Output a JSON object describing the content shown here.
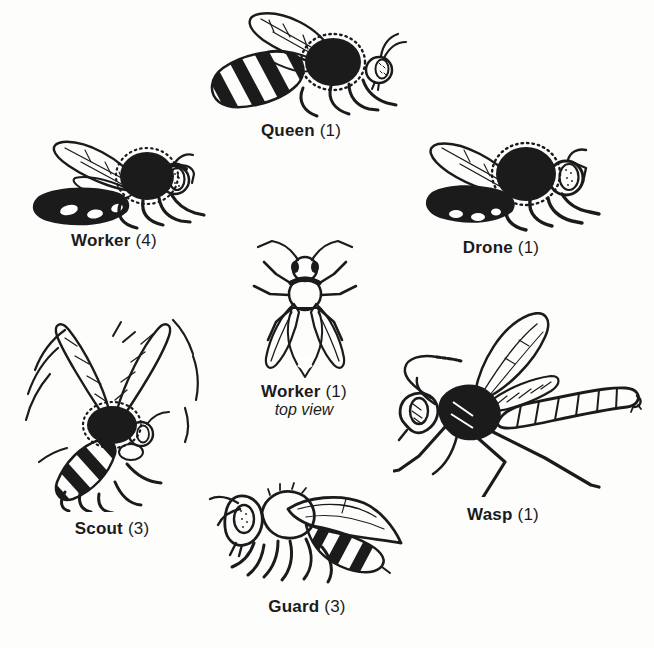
{
  "figure": {
    "items": [
      {
        "id": "queen",
        "label": "Queen",
        "count": "(1)"
      },
      {
        "id": "worker-side",
        "label": "Worker",
        "count": "(4)"
      },
      {
        "id": "drone",
        "label": "Drone",
        "count": "(1)"
      },
      {
        "id": "worker-top",
        "label": "Worker",
        "count": "(1)",
        "sublabel": "top view"
      },
      {
        "id": "scout",
        "label": "Scout",
        "count": "(3)"
      },
      {
        "id": "wasp",
        "label": "Wasp",
        "count": "(1)"
      },
      {
        "id": "guard",
        "label": "Guard",
        "count": "(3)"
      }
    ]
  },
  "colors": {
    "ink": "#1b1b1b",
    "paper": "#fdfdfc"
  }
}
